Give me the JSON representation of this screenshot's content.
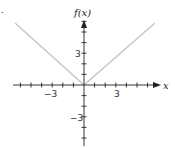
{
  "chart_data": {
    "type": "line",
    "title": "",
    "xlabel": "x",
    "ylabel": "f(x)",
    "function": "f(x) = |x|",
    "series": [
      {
        "name": "f(x)",
        "color": "#c8c8c8",
        "points": [
          [
            -6.5,
            6.5
          ],
          [
            -3,
            3
          ],
          [
            0,
            0
          ],
          [
            3,
            3
          ],
          [
            6.5,
            6.5
          ]
        ]
      }
    ],
    "x_ticks": [
      -6,
      -5,
      -4,
      -3,
      -2,
      -1,
      1,
      2,
      3,
      4,
      5,
      6
    ],
    "y_ticks": [
      -5,
      -4,
      -3,
      -2,
      -1,
      1,
      2,
      3,
      4,
      5,
      6
    ],
    "x_tick_labels": [
      {
        "value": -3,
        "label": "−3"
      },
      {
        "value": 3,
        "label": "3"
      }
    ],
    "y_tick_labels": [
      {
        "value": 3,
        "label": "3"
      },
      {
        "value": -3,
        "label": "−3"
      }
    ],
    "xlim": [
      -6.5,
      7
    ],
    "ylim": [
      -5.6,
      6
    ],
    "grid": false,
    "legend": "none"
  },
  "labels": {
    "y_axis": "f(x)",
    "x_axis": "x",
    "x_neg3": "−3",
    "x_pos3": "3",
    "y_pos3": "3",
    "y_neg3": "−3",
    "corner_mark": "."
  },
  "colors": {
    "axis": "#222222",
    "curve": "#c8c8c8"
  }
}
